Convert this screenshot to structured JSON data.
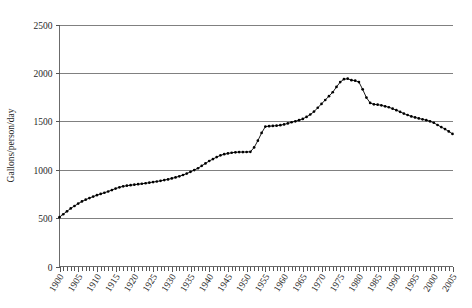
{
  "chart_data": {
    "type": "line",
    "title": "",
    "subtitle": "",
    "xlabel": "",
    "ylabel": "Gallons/person/day",
    "xlim": [
      1900,
      2005
    ],
    "ylim": [
      0,
      2500
    ],
    "grid": true,
    "legend": false,
    "legend_position": "none",
    "marker": "filled-circle",
    "y_ticks": [
      0,
      500,
      1000,
      1500,
      2000,
      2500
    ],
    "y_tick_labels": [
      "0",
      "500",
      "1000",
      "1500",
      "2000",
      "2500"
    ],
    "x_ticks": [
      1900,
      1905,
      1910,
      1915,
      1920,
      1925,
      1930,
      1935,
      1940,
      1945,
      1950,
      1955,
      1960,
      1965,
      1970,
      1975,
      1980,
      1985,
      1990,
      1995,
      2000,
      2005
    ],
    "x_tick_labels": [
      "1900",
      "1905",
      "1910",
      "1915",
      "1920",
      "1925",
      "1930",
      "1935",
      "1940",
      "1945",
      "1950",
      "1955",
      "1960",
      "1965",
      "1970",
      "1975",
      "1980",
      "1985",
      "1990",
      "1995",
      "2000",
      "2005"
    ],
    "x_minor_tick_interval": 1,
    "series": [
      {
        "name": "Gallons/person/day",
        "color": "#000000",
        "x": [
          1900,
          1901,
          1902,
          1903,
          1904,
          1905,
          1906,
          1907,
          1908,
          1909,
          1910,
          1911,
          1912,
          1913,
          1914,
          1915,
          1916,
          1917,
          1918,
          1919,
          1920,
          1921,
          1922,
          1923,
          1924,
          1925,
          1926,
          1927,
          1928,
          1929,
          1930,
          1931,
          1932,
          1933,
          1934,
          1935,
          1936,
          1937,
          1938,
          1939,
          1940,
          1941,
          1942,
          1943,
          1944,
          1945,
          1946,
          1947,
          1948,
          1949,
          1950,
          1951,
          1952,
          1953,
          1954,
          1955,
          1956,
          1957,
          1958,
          1959,
          1960,
          1961,
          1962,
          1963,
          1964,
          1965,
          1966,
          1967,
          1968,
          1969,
          1970,
          1971,
          1972,
          1973,
          1974,
          1975,
          1976,
          1977,
          1978,
          1979,
          1980,
          1981,
          1982,
          1983,
          1984,
          1985,
          1986,
          1987,
          1988,
          1989,
          1990,
          1991,
          1992,
          1993,
          1994,
          1995,
          1996,
          1997,
          1998,
          1999,
          2000,
          2001,
          2002,
          2003,
          2004,
          2005
        ],
        "values": [
          510,
          540,
          570,
          600,
          625,
          650,
          672,
          690,
          707,
          722,
          737,
          750,
          762,
          775,
          790,
          805,
          818,
          828,
          835,
          840,
          845,
          850,
          855,
          860,
          866,
          872,
          878,
          885,
          893,
          900,
          910,
          920,
          932,
          945,
          960,
          978,
          996,
          1015,
          1040,
          1065,
          1090,
          1110,
          1130,
          1148,
          1160,
          1168,
          1175,
          1180,
          1182,
          1182,
          1183,
          1185,
          1230,
          1300,
          1380,
          1445,
          1450,
          1452,
          1455,
          1460,
          1468,
          1478,
          1490,
          1500,
          1512,
          1525,
          1545,
          1570,
          1600,
          1640,
          1680,
          1720,
          1760,
          1800,
          1855,
          1905,
          1935,
          1940,
          1925,
          1920,
          1905,
          1830,
          1745,
          1690,
          1675,
          1672,
          1665,
          1655,
          1645,
          1630,
          1615,
          1598,
          1580,
          1565,
          1550,
          1540,
          1530,
          1520,
          1512,
          1500,
          1485,
          1462,
          1440,
          1420,
          1395,
          1370
        ]
      }
    ]
  }
}
